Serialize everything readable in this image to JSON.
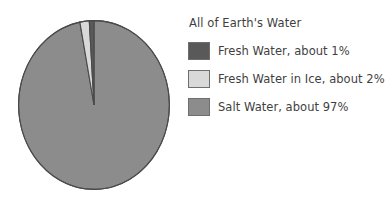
{
  "chart_data": {
    "type": "pie",
    "title": "All of Earth's Water",
    "categories": [
      "Fresh Water",
      "Fresh Water in Ice",
      "Salt Water"
    ],
    "values": [
      1,
      2,
      97
    ],
    "value_unit": "%",
    "labels": [
      "Fresh Water, about 1%",
      "Fresh Water in Ice, about 2%",
      "Salt Water, about 97%"
    ],
    "colors": [
      "#595959",
      "#d9d9d9",
      "#8c8c8c"
    ],
    "slice_border_color": "#4a4a4a",
    "start_angle_deg": 0,
    "direction": "counterclockwise",
    "legend_position": "right",
    "grid": false,
    "background": "#ffffff",
    "xlabel": "",
    "ylabel": ""
  },
  "legend": {
    "title": "All of Earth's Water",
    "items": [
      {
        "label": "Fresh Water, about 1%",
        "color": "#595959",
        "percent": 1
      },
      {
        "label": "Fresh Water in Ice, about 2%",
        "color": "#d9d9d9",
        "percent": 2
      },
      {
        "label": "Salt Water, about 97%",
        "color": "#8c8c8c",
        "percent": 97
      }
    ]
  }
}
